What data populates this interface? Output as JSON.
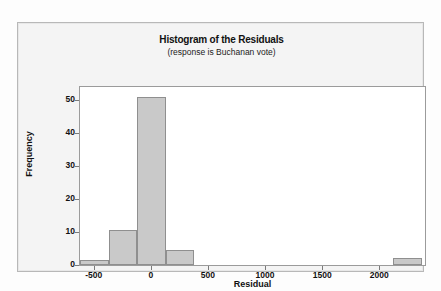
{
  "chart_data": {
    "type": "bar",
    "title": "Histogram of the Residuals",
    "subtitle": "(response is Buchanan vote)",
    "xlabel": "Residual",
    "ylabel": "Frequency",
    "xlim": [
      -620,
      2400
    ],
    "ylim": [
      0,
      54
    ],
    "grid": false,
    "legend": null,
    "bin_width": 250,
    "xticks": [
      "-500",
      "0",
      "500",
      "1000",
      "1500",
      "2000"
    ],
    "xtick_values": [
      -500,
      0,
      500,
      1000,
      1500,
      2000
    ],
    "yticks": [
      "0",
      "10",
      "20",
      "30",
      "40",
      "50"
    ],
    "ytick_values": [
      0,
      10,
      20,
      30,
      40,
      50
    ],
    "bars": [
      {
        "bin_start": -620,
        "bin_end": -370,
        "value": 1.5
      },
      {
        "bin_start": -370,
        "bin_end": -120,
        "value": 10.5
      },
      {
        "bin_start": -120,
        "bin_end": 130,
        "value": 51
      },
      {
        "bin_start": 130,
        "bin_end": 380,
        "value": 4.5
      },
      {
        "bin_start": 2120,
        "bin_end": 2370,
        "value": 2
      }
    ],
    "categories": [
      "-620 to -370",
      "-370 to -120",
      "-120 to 130",
      "130 to 380",
      "2120 to 2370"
    ],
    "values": [
      1.5,
      10.5,
      51,
      4.5,
      2
    ],
    "bar_fill_color": "#c9c9c9",
    "bar_edge_color": "#8f8f8f",
    "plot_background": "#ffffff",
    "frame_background": "#f4f4f4"
  }
}
